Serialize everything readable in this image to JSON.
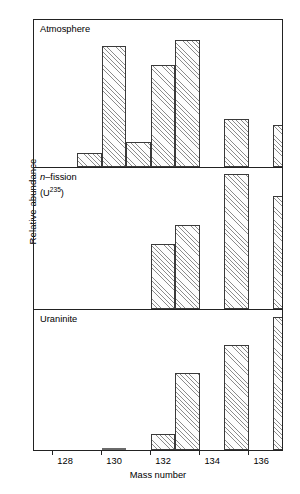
{
  "chart_data": {
    "type": "bar",
    "title": "",
    "xlabel": "Mass number",
    "ylabel": "Relative abundance",
    "grid": false,
    "legend": "none",
    "xlim": [
      127.2,
      137.4
    ],
    "ylim": [
      0,
      1
    ],
    "tick_labels": [
      "128",
      "130",
      "132",
      "134",
      "136"
    ],
    "tick_values": [
      128,
      130,
      132,
      134,
      136
    ],
    "categories": [
      129,
      130,
      131,
      132,
      134,
      136
    ],
    "panels": [
      {
        "label": "Atmosphere",
        "label_plain": "Atmosphere",
        "series_name": "Atmosphere",
        "x": [
          129,
          130,
          131,
          132,
          134,
          136
        ],
        "values": [
          0.1,
          0.86,
          0.18,
          0.72,
          0.9,
          0.34,
          0.3
        ]
      },
      {
        "label": "n-fission (U235)",
        "label_italic_prefix": "n",
        "label_rest": "–fission",
        "label_line2_pre": "(U",
        "label_line2_sup": "235",
        "label_line2_post": ")",
        "series_name": "n-fission (U-235)",
        "x": [
          131,
          132,
          134,
          136
        ],
        "values": [
          0.48,
          0.62,
          1.0,
          0.84
        ]
      },
      {
        "label": "Uraninite",
        "label_plain": "Uraninite",
        "series_name": "Uraninite",
        "x": [
          129,
          131,
          132,
          134,
          136
        ],
        "values": [
          0.02,
          0.12,
          0.58,
          0.79,
          1.0
        ]
      }
    ]
  },
  "figure": {
    "ylabel": "Relative abundance",
    "xlabel": "Mass number",
    "panel1_title": "Atmosphere",
    "panel2_title_n": "n",
    "panel2_title_fission": "–fission",
    "panel2_title_u_open": "(U",
    "panel2_title_u_sup": "235",
    "panel2_title_u_close": ")",
    "panel3_title": "Uraninite",
    "tick0": "128",
    "tick1": "130",
    "tick2": "132",
    "tick3": "134",
    "tick4": "136"
  }
}
